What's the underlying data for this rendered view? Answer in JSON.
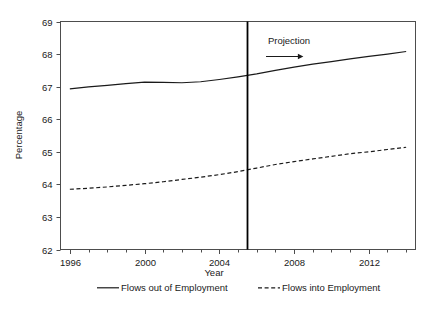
{
  "chart_data": {
    "type": "line",
    "title": "",
    "xlabel": "Year",
    "ylabel": "Percentage",
    "xlim": [
      1995.5,
      2014.5
    ],
    "ylim": [
      62,
      69
    ],
    "grid": false,
    "legend_position": "bottom",
    "x_ticks_major": [
      1996,
      2000,
      2004,
      2008,
      2012
    ],
    "x_tick_labels": [
      "1996",
      "2000",
      "2004",
      "2008",
      "2012"
    ],
    "x_ticks_minor": [
      1997,
      1998,
      1999,
      2001,
      2002,
      2003,
      2005,
      2006,
      2007,
      2009,
      2010,
      2011,
      2013,
      2014
    ],
    "y_ticks": [
      62,
      63,
      64,
      65,
      66,
      67,
      68,
      69
    ],
    "y_tick_labels": [
      "62",
      "63",
      "64",
      "65",
      "66",
      "67",
      "68",
      "69"
    ],
    "x": [
      1996,
      1997,
      1998,
      1999,
      2000,
      2001,
      2002,
      2003,
      2004,
      2005,
      2006,
      2007,
      2008,
      2009,
      2010,
      2011,
      2012,
      2013,
      2014
    ],
    "series": [
      {
        "name": "Flows out of Employment",
        "style": "solid",
        "color": "#1a1a1a",
        "values": [
          66.93,
          66.99,
          67.04,
          67.09,
          67.14,
          67.13,
          67.12,
          67.15,
          67.22,
          67.3,
          67.39,
          67.5,
          67.6,
          67.69,
          67.77,
          67.85,
          67.93,
          68.0,
          68.08
        ]
      },
      {
        "name": "Flows into Employment",
        "style": "dashed",
        "color": "#1a1a1a",
        "values": [
          63.85,
          63.88,
          63.92,
          63.97,
          64.02,
          64.08,
          64.15,
          64.22,
          64.3,
          64.39,
          64.5,
          64.61,
          64.7,
          64.78,
          64.86,
          64.94,
          65.0,
          65.07,
          65.14
        ]
      }
    ],
    "annotations": [
      {
        "name": "projection-divider",
        "type": "vline",
        "x": 2005.5
      },
      {
        "name": "projection-label",
        "type": "text",
        "text": "Projection",
        "x": 2006.6,
        "y": 68.3
      },
      {
        "name": "projection-arrow",
        "type": "arrow",
        "x_start": 2006.5,
        "x_end": 2008.5,
        "y": 67.95
      }
    ],
    "legend": [
      {
        "label": "Flows out of Employment",
        "style": "solid"
      },
      {
        "label": "Flows into Employment",
        "style": "dashed"
      }
    ]
  }
}
